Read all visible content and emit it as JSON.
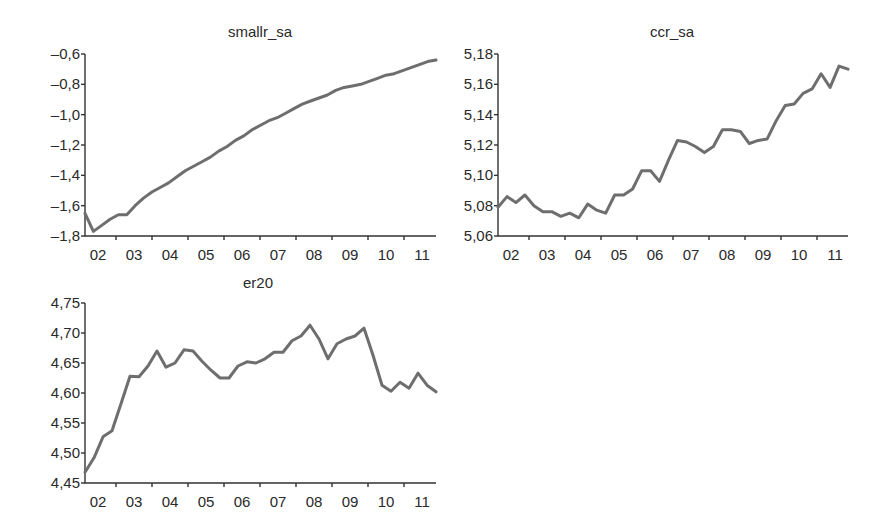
{
  "chart_data": [
    {
      "type": "line",
      "title": "smallr_sa",
      "xlabel": "",
      "ylabel": "",
      "x_tick_labels": [
        "02",
        "03",
        "04",
        "05",
        "06",
        "07",
        "08",
        "09",
        "10",
        "11"
      ],
      "y_tick_labels": [
        "-0,6",
        "-0,8",
        "-1,0",
        "-1,2",
        "-1,4",
        "-1,6",
        "-1,8"
      ],
      "ylim": [
        -1.8,
        -0.6
      ],
      "frequency": "quarterly",
      "x_range": [
        "2002Q1",
        "2011Q4"
      ],
      "grid": false,
      "legend": null,
      "values": [
        -1.65,
        -1.77,
        -1.73,
        -1.69,
        -1.66,
        -1.66,
        -1.6,
        -1.55,
        -1.51,
        -1.48,
        -1.45,
        -1.41,
        -1.37,
        -1.34,
        -1.31,
        -1.28,
        -1.24,
        -1.21,
        -1.17,
        -1.14,
        -1.1,
        -1.07,
        -1.04,
        -1.02,
        -0.99,
        -0.96,
        -0.93,
        -0.91,
        -0.89,
        -0.87,
        -0.84,
        -0.82,
        -0.81,
        -0.8,
        -0.78,
        -0.76,
        -0.74,
        -0.73,
        -0.71,
        -0.69,
        -0.67,
        -0.65,
        -0.64
      ]
    },
    {
      "type": "line",
      "title": "ccr_sa",
      "xlabel": "",
      "ylabel": "",
      "x_tick_labels": [
        "02",
        "03",
        "04",
        "05",
        "06",
        "07",
        "08",
        "09",
        "10",
        "11"
      ],
      "y_tick_labels": [
        "5,18",
        "5,16",
        "5,14",
        "5,12",
        "5,10",
        "5,08",
        "5,06"
      ],
      "ylim": [
        5.06,
        5.18
      ],
      "frequency": "quarterly",
      "x_range": [
        "2002Q1",
        "2011Q4"
      ],
      "grid": false,
      "legend": null,
      "values": [
        5.079,
        5.086,
        5.082,
        5.087,
        5.08,
        5.076,
        5.076,
        5.073,
        5.075,
        5.072,
        5.081,
        5.077,
        5.075,
        5.087,
        5.087,
        5.091,
        5.103,
        5.103,
        5.096,
        5.11,
        5.123,
        5.122,
        5.119,
        5.115,
        5.119,
        5.13,
        5.13,
        5.129,
        5.121,
        5.123,
        5.124,
        5.136,
        5.146,
        5.147,
        5.154,
        5.157,
        5.167,
        5.158,
        5.172,
        5.17
      ]
    },
    {
      "type": "line",
      "title": "er20",
      "xlabel": "",
      "ylabel": "",
      "x_tick_labels": [
        "02",
        "03",
        "04",
        "05",
        "06",
        "07",
        "08",
        "09",
        "10",
        "11"
      ],
      "y_tick_labels": [
        "4,75",
        "4,70",
        "4,65",
        "4,60",
        "4,55",
        "4,50",
        "4,45"
      ],
      "ylim": [
        4.45,
        4.75
      ],
      "frequency": "quarterly",
      "x_range": [
        "2002Q1",
        "2011Q4"
      ],
      "grid": false,
      "legend": null,
      "values": [
        4.468,
        4.492,
        4.527,
        4.537,
        4.582,
        4.628,
        4.627,
        4.645,
        4.67,
        4.643,
        4.65,
        4.672,
        4.67,
        4.653,
        4.638,
        4.625,
        4.625,
        4.645,
        4.652,
        4.65,
        4.657,
        4.668,
        4.668,
        4.687,
        4.695,
        4.713,
        4.69,
        4.657,
        4.682,
        4.69,
        4.695,
        4.708,
        4.663,
        4.613,
        4.603,
        4.618,
        4.608,
        4.633,
        4.613,
        4.602
      ]
    }
  ]
}
